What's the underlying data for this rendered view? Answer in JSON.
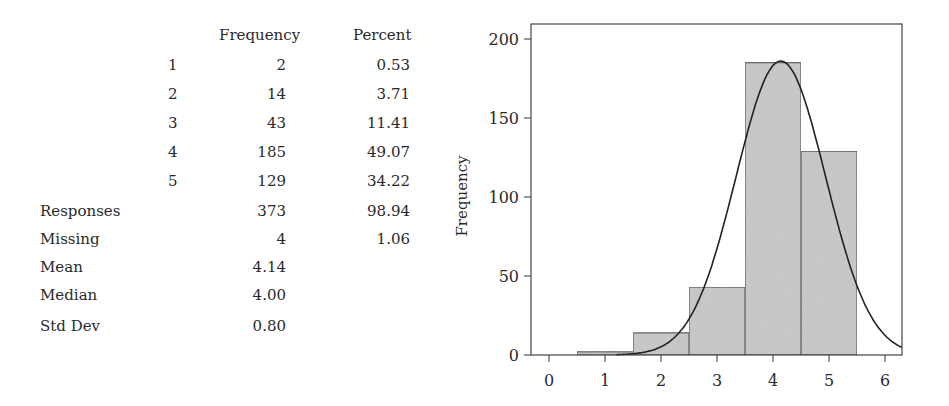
{
  "table": {
    "headers": {
      "frequency": "Frequency",
      "percent": "Percent"
    },
    "rows": [
      {
        "category": "1",
        "frequency": "2",
        "percent": "0.53"
      },
      {
        "category": "2",
        "frequency": "14",
        "percent": "3.71"
      },
      {
        "category": "3",
        "frequency": "43",
        "percent": "11.41"
      },
      {
        "category": "4",
        "frequency": "185",
        "percent": "49.07"
      },
      {
        "category": "5",
        "frequency": "129",
        "percent": "34.22"
      }
    ],
    "summary": [
      {
        "label": "Responses",
        "frequency": "373",
        "percent": "98.94"
      },
      {
        "label": "Missing",
        "frequency": "4",
        "percent": "1.06"
      },
      {
        "label": "Mean",
        "frequency": "4.14",
        "percent": ""
      },
      {
        "label": "Median",
        "frequency": "4.00",
        "percent": ""
      },
      {
        "label": "Std Dev",
        "frequency": "0.80",
        "percent": ""
      }
    ]
  },
  "chart_data": {
    "type": "bar",
    "subtype": "histogram_with_normal_curve",
    "title": "",
    "xlabel": "",
    "ylabel": "Frequency",
    "categories": [
      "1",
      "2",
      "3",
      "4",
      "5"
    ],
    "values": [
      2,
      14,
      43,
      185,
      129
    ],
    "bin_width": 1,
    "xlim": [
      -0.3,
      6.3
    ],
    "ylim": [
      0,
      210
    ],
    "xticks": [
      "0",
      "1",
      "2",
      "3",
      "4",
      "5",
      "6"
    ],
    "yticks": [
      "0",
      "50",
      "100",
      "150",
      "200"
    ],
    "overlay": {
      "type": "normal_curve",
      "mean": 4.14,
      "std": 0.8,
      "n": 373
    },
    "grid": false,
    "legend": null,
    "colors": {
      "bar_fill": "#c8c8c8",
      "bar_edge": "#444444",
      "curve": "#222222",
      "frame": "#444444"
    }
  }
}
